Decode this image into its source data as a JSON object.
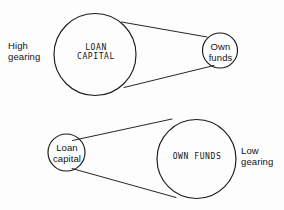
{
  "figure": {
    "background_color": "#fdfdfd",
    "stroke_color": "#1a1a1a",
    "diagrams": [
      {
        "name": "high-gearing",
        "side_label": "High\ngearing",
        "large_circle_label": "LOAN\nCAPITAL",
        "small_circle_label": "Own\nfunds"
      },
      {
        "name": "low-gearing",
        "side_label": "Low\ngearing",
        "large_circle_label": "OWN FUNDS",
        "small_circle_label": "Loan\ncapital"
      }
    ]
  },
  "labels": {
    "high_gearing": "High\ngearing",
    "loan_capital_upper": "LOAN\nCAPITAL",
    "own_funds_upper": "Own\nfunds",
    "loan_capital_lower": "Loan\ncapital",
    "own_funds_lower": "OWN FUNDS",
    "low_gearing": "Low\ngearing"
  }
}
